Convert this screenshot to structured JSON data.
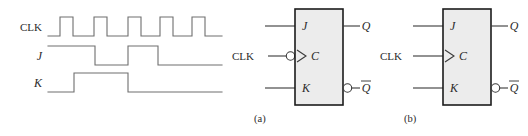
{
  "figure": {
    "background_color": "#ffffff",
    "wire_color": "#6e6e6e",
    "box_fill_color": "#ececec",
    "box_border_color": "#1c1c1c"
  },
  "timing": {
    "signals": [
      {
        "name": "clk",
        "label": "CLK",
        "label_style": "upright",
        "description": "Five narrow positive clock pulses",
        "baseline_y": 36,
        "high_y": 17,
        "start_x": 48,
        "end_x": 222,
        "pulses": [
          {
            "rise_x": 60,
            "fall_x": 73
          },
          {
            "rise_x": 94,
            "fall_x": 107
          },
          {
            "rise_x": 128,
            "fall_x": 141
          },
          {
            "rise_x": 160,
            "fall_x": 173
          },
          {
            "rise_x": 192,
            "fall_x": 205
          }
        ]
      },
      {
        "name": "j",
        "label": "J",
        "label_style": "italic",
        "description": "J high from start to third clock region, low, then high again, then low",
        "baseline_y": 65,
        "high_y": 46,
        "start_x": 48,
        "end_x": 222,
        "pulses": [
          {
            "rise_x": 48,
            "fall_x": 95
          },
          {
            "rise_x": 128,
            "fall_x": 158
          }
        ]
      },
      {
        "name": "k",
        "label": "K",
        "label_style": "italic",
        "description": "K high for one interval between first and third clock pulse",
        "baseline_y": 92,
        "high_y": 73,
        "start_x": 48,
        "end_x": 222,
        "pulses": [
          {
            "rise_x": 74,
            "fall_x": 128
          }
        ]
      }
    ]
  },
  "symbols": [
    {
      "id": "a",
      "caption": "(a)",
      "caption_x": 254,
      "caption_y": 122,
      "box": {
        "x": 295,
        "y": 9,
        "width": 48,
        "height": 96
      },
      "clk_triggered": "negative-edge",
      "inputs": [
        {
          "name": "j",
          "label": "J",
          "pin_y": 26,
          "lead_from_x": 265,
          "external_label": ""
        },
        {
          "name": "clk",
          "label": "C",
          "pin_y": 56,
          "lead_from_x": 268,
          "external_label": "CLK",
          "external_label_x": 243,
          "has_bubble": true,
          "has_triangle": true
        },
        {
          "name": "k",
          "label": "K",
          "pin_y": 88,
          "lead_from_x": 265,
          "external_label": ""
        }
      ],
      "outputs": [
        {
          "name": "q",
          "label": "Q",
          "overbar": false,
          "pin_y": 26,
          "lead_to_x": 372,
          "label_x": 377,
          "has_bubble": false
        },
        {
          "name": "qbar",
          "label": "Q",
          "overbar": true,
          "pin_y": 88,
          "lead_to_x": 372,
          "label_x": 377,
          "has_bubble": true
        }
      ]
    },
    {
      "id": "b",
      "caption": "(b)",
      "caption_x": 404,
      "caption_y": 122,
      "box": {
        "x": 443,
        "y": 9,
        "width": 48,
        "height": 96
      },
      "clk_triggered": "positive-edge",
      "inputs": [
        {
          "name": "j",
          "label": "J",
          "pin_y": 26,
          "lead_from_x": 413,
          "external_label": ""
        },
        {
          "name": "clk",
          "label": "C",
          "pin_y": 56,
          "lead_from_x": 413,
          "external_label": "CLK",
          "external_label_x": 391,
          "has_bubble": false,
          "has_triangle": true
        },
        {
          "name": "k",
          "label": "K",
          "pin_y": 88,
          "lead_from_x": 413,
          "external_label": ""
        }
      ],
      "outputs": [
        {
          "name": "q",
          "label": "Q",
          "overbar": false,
          "pin_y": 26,
          "lead_to_x": 520,
          "label_x": 508,
          "has_bubble": false
        },
        {
          "name": "qbar",
          "label": "Q",
          "overbar": true,
          "pin_y": 88,
          "lead_to_x": 520,
          "label_x": 508,
          "has_bubble": true
        }
      ]
    }
  ]
}
